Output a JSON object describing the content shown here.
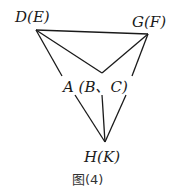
{
  "diagram": {
    "labels": {
      "top_left": "D(E)",
      "top_right": "G(F)",
      "middle": "A (B、C)",
      "bottom": "H(K)"
    },
    "caption": "图(4)"
  }
}
